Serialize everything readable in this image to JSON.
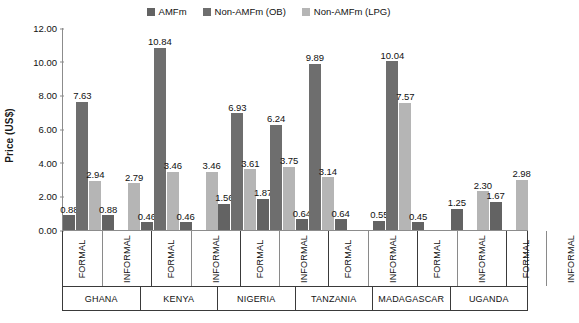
{
  "chart_data": {
    "type": "bar",
    "title": "",
    "xlabel": "",
    "ylabel": "Price (US$)",
    "ylim": [
      0,
      12
    ],
    "ytick_values": [
      12,
      10,
      8,
      6,
      4,
      2,
      0
    ],
    "ytick_labels": [
      "12.00",
      "10.00",
      "8.00",
      "6.00",
      "4.00",
      "2.00",
      "0.00"
    ],
    "grid": false,
    "legend_position": "top-center",
    "series": [
      {
        "name": "AMFm",
        "color": "#636363"
      },
      {
        "name": "Non-AMFm (OB)",
        "color": "#6e6e6e"
      },
      {
        "name": "Non-AMFm (LPG)",
        "color": "#b5b5b5"
      }
    ],
    "categories": [
      {
        "country": "GHANA",
        "sector": "FORMAL"
      },
      {
        "country": "GHANA",
        "sector": "INFORMAL"
      },
      {
        "country": "KENYA",
        "sector": "FORMAL"
      },
      {
        "country": "KENYA",
        "sector": "INFORMAL"
      },
      {
        "country": "NIGERIA",
        "sector": "FORMAL"
      },
      {
        "country": "NIGERIA",
        "sector": "INFORMAL"
      },
      {
        "country": "TANZANIA",
        "sector": "FORMAL"
      },
      {
        "country": "TANZANIA",
        "sector": "INFORMAL"
      },
      {
        "country": "MADAGASCAR",
        "sector": "FORMAL"
      },
      {
        "country": "MADAGASCAR",
        "sector": "INFORMAL"
      },
      {
        "country": "UGANDA",
        "sector": "FORMAL"
      },
      {
        "country": "UGANDA",
        "sector": "INFORMAL"
      }
    ],
    "countries": [
      {
        "name": "GHANA"
      },
      {
        "name": "KENYA"
      },
      {
        "name": "NIGERIA"
      },
      {
        "name": "TANZANIA"
      },
      {
        "name": "MADAGASCAR"
      },
      {
        "name": "UGANDA"
      }
    ],
    "values": {
      "AMFm": [
        0.88,
        0.88,
        0.46,
        0.46,
        1.56,
        1.87,
        0.64,
        0.64,
        0.55,
        0.45,
        1.25,
        1.67
      ],
      "Non-AMFm (OB)": [
        7.63,
        null,
        10.84,
        null,
        6.93,
        6.24,
        9.89,
        null,
        10.04,
        null,
        null,
        null
      ],
      "Non-AMFm (LPG)": [
        2.94,
        2.79,
        3.46,
        3.46,
        3.61,
        3.75,
        3.14,
        null,
        7.57,
        null,
        2.3,
        2.98
      ]
    },
    "groups": [
      {
        "country": "GHANA",
        "sectors": [
          {
            "sector": "FORMAL",
            "bars": [
              {
                "series": "AMFm",
                "value": 0.88,
                "label": "0.88"
              },
              {
                "series": "Non-AMFm (OB)",
                "value": 7.63,
                "label": "7.63"
              },
              {
                "series": "Non-AMFm (LPG)",
                "value": 2.94,
                "label": "2.94"
              }
            ]
          },
          {
            "sector": "INFORMAL",
            "bars": [
              {
                "series": "AMFm",
                "value": 0.88,
                "label": "0.88"
              },
              {
                "series": "Non-AMFm (OB)",
                "value": null,
                "label": ""
              },
              {
                "series": "Non-AMFm (LPG)",
                "value": 2.79,
                "label": "2.79"
              }
            ]
          }
        ]
      },
      {
        "country": "KENYA",
        "sectors": [
          {
            "sector": "FORMAL",
            "bars": [
              {
                "series": "AMFm",
                "value": 0.46,
                "label": "0.46"
              },
              {
                "series": "Non-AMFm (OB)",
                "value": 10.84,
                "label": "10.84"
              },
              {
                "series": "Non-AMFm (LPG)",
                "value": 3.46,
                "label": "3.46"
              }
            ]
          },
          {
            "sector": "INFORMAL",
            "bars": [
              {
                "series": "AMFm",
                "value": 0.46,
                "label": "0.46"
              },
              {
                "series": "Non-AMFm (OB)",
                "value": null,
                "label": ""
              },
              {
                "series": "Non-AMFm (LPG)",
                "value": 3.46,
                "label": "3.46"
              }
            ]
          }
        ]
      },
      {
        "country": "NIGERIA",
        "sectors": [
          {
            "sector": "FORMAL",
            "bars": [
              {
                "series": "AMFm",
                "value": 1.56,
                "label": "1.56"
              },
              {
                "series": "Non-AMFm (OB)",
                "value": 6.93,
                "label": "6.93"
              },
              {
                "series": "Non-AMFm (LPG)",
                "value": 3.61,
                "label": "3.61"
              }
            ]
          },
          {
            "sector": "INFORMAL",
            "bars": [
              {
                "series": "AMFm",
                "value": 1.87,
                "label": "1.87"
              },
              {
                "series": "Non-AMFm (OB)",
                "value": 6.24,
                "label": "6.24"
              },
              {
                "series": "Non-AMFm (LPG)",
                "value": 3.75,
                "label": "3.75"
              }
            ]
          }
        ]
      },
      {
        "country": "TANZANIA",
        "sectors": [
          {
            "sector": "FORMAL",
            "bars": [
              {
                "series": "AMFm",
                "value": 0.64,
                "label": "0.64"
              },
              {
                "series": "Non-AMFm (OB)",
                "value": 9.89,
                "label": "9.89"
              },
              {
                "series": "Non-AMFm (LPG)",
                "value": 3.14,
                "label": "3.14"
              }
            ]
          },
          {
            "sector": "INFORMAL",
            "bars": [
              {
                "series": "AMFm",
                "value": 0.64,
                "label": "0.64"
              },
              {
                "series": "Non-AMFm (OB)",
                "value": null,
                "label": ""
              },
              {
                "series": "Non-AMFm (LPG)",
                "value": null,
                "label": ""
              }
            ]
          }
        ]
      },
      {
        "country": "MADAGASCAR",
        "sectors": [
          {
            "sector": "FORMAL",
            "bars": [
              {
                "series": "AMFm",
                "value": 0.55,
                "label": "0.55"
              },
              {
                "series": "Non-AMFm (OB)",
                "value": 10.04,
                "label": "10.04"
              },
              {
                "series": "Non-AMFm (LPG)",
                "value": 7.57,
                "label": "7.57"
              }
            ]
          },
          {
            "sector": "INFORMAL",
            "bars": [
              {
                "series": "AMFm",
                "value": 0.45,
                "label": "0.45"
              },
              {
                "series": "Non-AMFm (OB)",
                "value": null,
                "label": ""
              },
              {
                "series": "Non-AMFm (LPG)",
                "value": null,
                "label": ""
              }
            ]
          }
        ]
      },
      {
        "country": "UGANDA",
        "sectors": [
          {
            "sector": "FORMAL",
            "bars": [
              {
                "series": "AMFm",
                "value": 1.25,
                "label": "1.25"
              },
              {
                "series": "Non-AMFm (OB)",
                "value": null,
                "label": ""
              },
              {
                "series": "Non-AMFm (LPG)",
                "value": 2.3,
                "label": "2.30"
              }
            ]
          },
          {
            "sector": "INFORMAL",
            "bars": [
              {
                "series": "AMFm",
                "value": 1.67,
                "label": "1.67"
              },
              {
                "series": "Non-AMFm (OB)",
                "value": null,
                "label": ""
              },
              {
                "series": "Non-AMFm (LPG)",
                "value": 2.98,
                "label": "2.98"
              }
            ]
          }
        ]
      }
    ]
  }
}
